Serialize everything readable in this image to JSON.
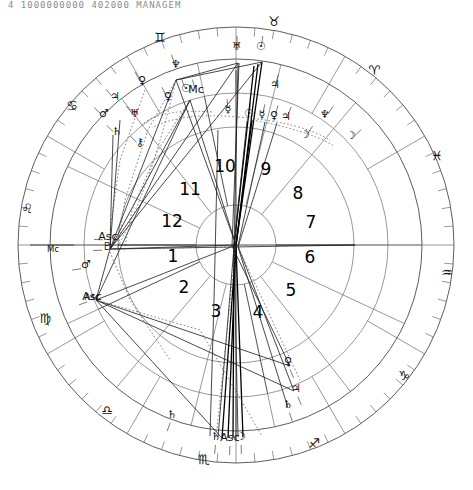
{
  "header": {
    "text": "4   1000000000   402000     MANAGEM"
  },
  "chart_data": {
    "type": "scatter",
    "xlabel": "",
    "ylabel": "",
    "chart_kind": "astrological-natal-wheel",
    "center": {
      "x": 236,
      "y": 245
    },
    "radii": {
      "outer_rim": 218,
      "zodiac_outer": 218,
      "zodiac_inner": 186,
      "degree_band_outer": 186,
      "degree_band_inner": 152,
      "house_band_outer": 152,
      "house_band_inner": 118,
      "inner_circle": 40
    },
    "house_numbers": [
      "1",
      "2",
      "3",
      "4",
      "5",
      "6",
      "7",
      "8",
      "9",
      "10",
      "11",
      "12"
    ],
    "house_number_positions": [
      {
        "label": "1",
        "x": 173,
        "y": 262
      },
      {
        "label": "2",
        "x": 184,
        "y": 293
      },
      {
        "label": "3",
        "x": 216,
        "y": 317
      },
      {
        "label": "4",
        "x": 258,
        "y": 318
      },
      {
        "label": "5",
        "x": 291,
        "y": 296
      },
      {
        "label": "6",
        "x": 310,
        "y": 263
      },
      {
        "label": "7",
        "x": 311,
        "y": 228
      },
      {
        "label": "8",
        "x": 298,
        "y": 199
      },
      {
        "label": "9",
        "x": 266,
        "y": 175
      },
      {
        "label": "10",
        "x": 225,
        "y": 172
      },
      {
        "label": "11",
        "x": 190,
        "y": 195
      },
      {
        "label": "12",
        "x": 172,
        "y": 227
      }
    ],
    "zodiac_signs": [
      {
        "name": "Aries",
        "glyph": "♈",
        "angle_deg": -62,
        "x": 374,
        "y": 75
      },
      {
        "name": "Taurus",
        "glyph": "♉",
        "angle_deg": -88,
        "x": 274,
        "y": 26
      },
      {
        "name": "Gemini",
        "glyph": "♊",
        "angle_deg": -114,
        "x": 160,
        "y": 42
      },
      {
        "name": "Cancer",
        "glyph": "♋",
        "angle_deg": -145,
        "x": 72,
        "y": 110
      },
      {
        "name": "Leo",
        "glyph": "♌",
        "angle_deg": -176,
        "x": 27,
        "y": 213
      },
      {
        "name": "Virgo",
        "glyph": "♍",
        "angle_deg": 153,
        "x": 45,
        "y": 323
      },
      {
        "name": "Libra",
        "glyph": "♎",
        "angle_deg": 122,
        "x": 107,
        "y": 415
      },
      {
        "name": "Scorpio",
        "glyph": "♏",
        "angle_deg": 92,
        "x": 204,
        "y": 464
      },
      {
        "name": "Sagittarius",
        "glyph": "♐",
        "angle_deg": 62,
        "x": 314,
        "y": 448
      },
      {
        "name": "Capricorn",
        "glyph": "♑",
        "angle_deg": 33,
        "x": 404,
        "y": 380
      },
      {
        "name": "Aquarius",
        "glyph": "♒",
        "angle_deg": 4,
        "x": 447,
        "y": 277
      },
      {
        "name": "Pisces",
        "glyph": "♓",
        "angle_deg": -28,
        "x": 437,
        "y": 160
      }
    ],
    "outer_planets": [
      {
        "name": "Sun",
        "glyph": "☉",
        "x": 261,
        "y": 50
      },
      {
        "name": "Uranus",
        "glyph": "♅",
        "x": 237,
        "y": 50
      },
      {
        "name": "Neptune",
        "glyph": "♆",
        "x": 176,
        "y": 68
      },
      {
        "name": "Venus",
        "glyph": "♀",
        "x": 142,
        "y": 84
      },
      {
        "name": "Jupiter",
        "glyph": "♃",
        "x": 115,
        "y": 100
      },
      {
        "name": "Mars",
        "glyph": "♂",
        "x": 104,
        "y": 117
      },
      {
        "name": "Jupiter-2",
        "glyph": "♃",
        "x": 275,
        "y": 88
      },
      {
        "name": "Moon",
        "glyph": "☽",
        "x": 351,
        "y": 139
      },
      {
        "name": "Neptune-2",
        "glyph": "♆",
        "x": 325,
        "y": 118
      }
    ],
    "inner_planets": [
      {
        "name": "Venus",
        "glyph": "♀",
        "x": 168,
        "y": 100
      },
      {
        "name": "Sun-2",
        "glyph": "☉",
        "x": 186,
        "y": 92
      },
      {
        "name": "MC-marker",
        "glyph": "Mc",
        "x": 196,
        "y": 93
      },
      {
        "name": "Saturn",
        "glyph": "♄",
        "x": 117,
        "y": 135
      },
      {
        "name": "Uranus-2",
        "glyph": "♅",
        "x": 135,
        "y": 117
      },
      {
        "name": "Chiron",
        "glyph": "⚷",
        "x": 140,
        "y": 146
      },
      {
        "name": "Sun-3",
        "glyph": "☉",
        "x": 249,
        "y": 117
      },
      {
        "name": "Mercury",
        "glyph": "☿",
        "x": 262,
        "y": 118
      },
      {
        "name": "Venus-2",
        "glyph": "♀",
        "x": 274,
        "y": 119
      },
      {
        "name": "Jupiter-3",
        "glyph": "♃",
        "x": 286,
        "y": 120
      },
      {
        "name": "Mercury-2",
        "glyph": "☿",
        "x": 228,
        "y": 113
      },
      {
        "name": "Moon-2",
        "glyph": "☽",
        "x": 305,
        "y": 138
      },
      {
        "name": "Pluto",
        "glyph": "♇",
        "x": 107,
        "y": 250
      },
      {
        "name": "Ascendant",
        "glyph": "Asc",
        "x": 108,
        "y": 240
      },
      {
        "name": "Mars-2",
        "glyph": "♂",
        "x": 86,
        "y": 268
      },
      {
        "name": "Ascendant-2",
        "glyph": "Asc",
        "x": 92,
        "y": 300
      },
      {
        "name": "Venus-3",
        "glyph": "♀",
        "x": 288,
        "y": 365
      },
      {
        "name": "Jupiter-4",
        "glyph": "♃",
        "x": 296,
        "y": 392
      },
      {
        "name": "Saturn-2",
        "glyph": "♄",
        "x": 216,
        "y": 440
      },
      {
        "name": "Ascendant-3",
        "glyph": "Asc",
        "x": 230,
        "y": 441
      },
      {
        "name": "Moon-3",
        "glyph": "☽",
        "x": 241,
        "y": 440
      },
      {
        "name": "Saturn-3",
        "glyph": "♄",
        "x": 172,
        "y": 418
      },
      {
        "name": "Saturn-4",
        "glyph": "♄",
        "x": 288,
        "y": 408
      }
    ],
    "axis_markers": [
      {
        "name": "MC",
        "label": "Mc",
        "x": 53,
        "y": 252
      },
      {
        "name": "Asc",
        "label": "Asc",
        "x": 92,
        "y": 300
      }
    ]
  }
}
